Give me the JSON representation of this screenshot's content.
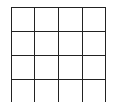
{
  "grid": {
    "rows": 4,
    "cols": 4,
    "line_color": "#222222",
    "background": "#ffffff"
  }
}
